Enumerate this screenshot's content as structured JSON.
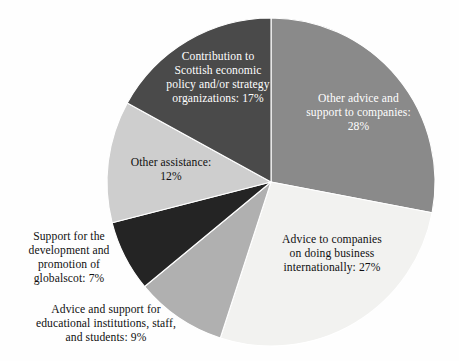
{
  "chart_data": {
    "type": "pie",
    "title": "",
    "subtitle": "",
    "xlabel": "",
    "ylabel": "",
    "legend_position": "none",
    "grid": false,
    "labels_inside": true,
    "start_angle_deg": 0,
    "direction": "clockwise",
    "total_percent": 100,
    "value_unit": "%",
    "categories": [
      "Other advice and support to companies",
      "Advice to companies on doing business internationally",
      "Advice and support for educational institutions, staff, and students",
      "Support for the development and promotion of globalscot",
      "Other assistance",
      "Contribution to Scottish economic policy and/or strategy organizations"
    ],
    "values": [
      28,
      27,
      9,
      7,
      12,
      17
    ],
    "colors": [
      "#8a8a8a",
      "#f2f2f0",
      "#b0b0b0",
      "#242424",
      "#cecece",
      "#4a4a4a"
    ],
    "slices": [
      {
        "name": "other-advice-and-support-to-companies",
        "label": "Other advice and\nsupport to companies:\n28%",
        "category": "Other advice and support to companies",
        "value": 28,
        "value_text": "28%",
        "color": "#8a8a8a",
        "text_color": "#ffffff",
        "label_placement": "inside"
      },
      {
        "name": "advice-to-companies-on-doing-business-internationally",
        "label": "Advice to companies\non doing business\ninternationally: 27%",
        "category": "Advice to companies on doing business internationally",
        "value": 27,
        "value_text": "27%",
        "color": "#f2f2f0",
        "text_color": "#101010",
        "label_placement": "inside"
      },
      {
        "name": "advice-and-support-for-educational-institutions",
        "label": "Advice and support for\neducational institutions, staff,\nand students: 9%",
        "category": "Advice and support for educational institutions, staff, and students",
        "value": 9,
        "value_text": "9%",
        "color": "#b0b0b0",
        "text_color": "#101010",
        "label_placement": "outside"
      },
      {
        "name": "support-for-development-and-promotion-of-globalscot",
        "label": "Support for the\ndevelopment and\npromotion of\nglobalscot: 7%",
        "category": "Support for the development and promotion of globalscot",
        "value": 7,
        "value_text": "7%",
        "color": "#242424",
        "text_color": "#101010",
        "label_placement": "outside"
      },
      {
        "name": "other-assistance",
        "label": "Other assistance:\n12%",
        "category": "Other assistance",
        "value": 12,
        "value_text": "12%",
        "color": "#cecece",
        "text_color": "#101010",
        "label_placement": "inside"
      },
      {
        "name": "contribution-to-scottish-economic-policy",
        "label": "Contribution to\nScottish economic\npolicy and/or strategy\norganizations: 17%",
        "category": "Contribution to Scottish economic policy and/or strategy organizations",
        "value": 17,
        "value_text": "17%",
        "color": "#4a4a4a",
        "text_color": "#ffffff",
        "label_placement": "inside"
      }
    ],
    "background_color": "#fefefe",
    "slice_border_color": "#ffffff"
  },
  "geometry": {
    "center_x": 271,
    "center_y": 182,
    "radius": 164
  }
}
